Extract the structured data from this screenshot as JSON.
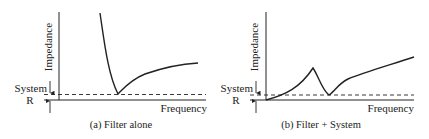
{
  "panels": [
    {
      "id": "a",
      "caption": "(a) Filter alone",
      "y_label": "Impedance",
      "x_label": "Frequency",
      "ref_label_top": "System",
      "ref_label_bottom": "R",
      "curve_description": "Impedance falls steeply to a sharp minimum at System R, then rises gradually"
    },
    {
      "id": "b",
      "caption": "(b) Filter + System",
      "y_label": "Impedance",
      "x_label": "Frequency",
      "ref_label_top": "System",
      "ref_label_bottom": "R",
      "curve_description": "Impedance rises from zero to a resonant peak, dips to System R, then rises steadily"
    }
  ],
  "colors": {
    "line": "#222222",
    "background": "#ffffff"
  }
}
